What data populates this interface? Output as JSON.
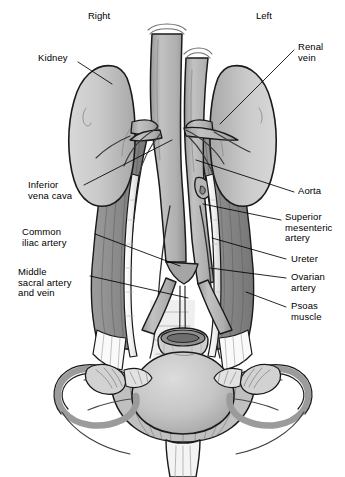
{
  "figure": {
    "kind": "anatomical-illustration",
    "background_color": "#ffffff",
    "line_color": "#1a1a1a",
    "label_color": "#000000"
  },
  "orientation": {
    "right": "Right",
    "left": "Left"
  },
  "labels": [
    {
      "id": "kidney",
      "text": "Kidney",
      "side": "left",
      "x": 38,
      "y": 55,
      "align": "left",
      "leader": [
        [
          78,
          62
        ],
        [
          112,
          84
        ]
      ]
    },
    {
      "id": "inferior-vena-cava",
      "text": "Inferior\nvena cava",
      "side": "left",
      "x": 28,
      "y": 181,
      "align": "left",
      "leader": [
        [
          82,
          186
        ],
        [
          170,
          140
        ]
      ]
    },
    {
      "id": "common-iliac-artery",
      "text": "Common\niliac artery",
      "side": "left",
      "x": 22,
      "y": 228,
      "align": "left",
      "leader": [
        [
          92,
          234
        ],
        [
          178,
          264
        ]
      ]
    },
    {
      "id": "middle-sacral",
      "text": "Middle\nsacral artery\nand vein",
      "side": "left",
      "x": 18,
      "y": 268,
      "align": "left",
      "leader": [
        [
          88,
          274
        ],
        [
          185,
          296
        ]
      ]
    },
    {
      "id": "renal-vein",
      "text": "Renal\nvein",
      "side": "right",
      "x": 297,
      "y": 44,
      "align": "left",
      "leader": [
        [
          295,
          50
        ],
        [
          222,
          122
        ]
      ]
    },
    {
      "id": "aorta",
      "text": "Aorta",
      "side": "right",
      "x": 297,
      "y": 188,
      "align": "left",
      "leader": [
        [
          295,
          193
        ],
        [
          196,
          160
        ]
      ]
    },
    {
      "id": "superior-mesenteric-artery",
      "text": "Superior\nmesenteric\nartery",
      "side": "right",
      "x": 284,
      "y": 214,
      "align": "left",
      "leader": [
        [
          281,
          220
        ],
        [
          205,
          205
        ]
      ]
    },
    {
      "id": "ureter",
      "text": "Ureter",
      "side": "right",
      "x": 290,
      "y": 256,
      "align": "left",
      "leader": [
        [
          287,
          260
        ],
        [
          214,
          238
        ]
      ]
    },
    {
      "id": "ovarian-artery",
      "text": "Ovarian\nartery",
      "side": "right",
      "x": 290,
      "y": 274,
      "align": "left",
      "leader": [
        [
          287,
          279
        ],
        [
          212,
          268
        ]
      ]
    },
    {
      "id": "psoas-muscle",
      "text": "Psoas\nmuscle",
      "side": "right",
      "x": 290,
      "y": 303,
      "align": "left",
      "leader": [
        [
          287,
          308
        ],
        [
          246,
          292
        ]
      ]
    }
  ],
  "structures": [
    {
      "id": "right-kidney",
      "name": "Right kidney",
      "tone": "#c9c9c9"
    },
    {
      "id": "left-kidney",
      "name": "Left kidney",
      "tone": "#c9c9c9"
    },
    {
      "id": "inferior-vena-cava",
      "name": "Inferior vena cava",
      "tone": "#b4b4b4"
    },
    {
      "id": "abdominal-aorta",
      "name": "Abdominal aorta",
      "tone": "#b0b0b0"
    },
    {
      "id": "right-psoas-muscle",
      "name": "Right psoas muscle",
      "tone": "#8e8e8e"
    },
    {
      "id": "left-psoas-muscle",
      "name": "Left psoas muscle",
      "tone": "#8e8e8e"
    },
    {
      "id": "right-ureter",
      "name": "Right ureter",
      "tone": "#f2f2f2"
    },
    {
      "id": "left-ureter",
      "name": "Left ureter",
      "tone": "#f2f2f2"
    },
    {
      "id": "uterus",
      "name": "Uterus",
      "tone": "#c5c5c5"
    },
    {
      "id": "broad-ligament",
      "name": "Broad ligament",
      "tone": "#bdbdbd"
    },
    {
      "id": "right-fallopian-tube",
      "name": "Right fallopian tube",
      "tone": "#9e9e9e"
    },
    {
      "id": "left-fallopian-tube",
      "name": "Left fallopian tube",
      "tone": "#9e9e9e"
    },
    {
      "id": "right-ovary",
      "name": "Right ovary",
      "tone": "#d5d5d5"
    },
    {
      "id": "left-ovary",
      "name": "Left ovary",
      "tone": "#d5d5d5"
    },
    {
      "id": "vagina",
      "name": "Vagina",
      "tone": "#ededed"
    },
    {
      "id": "sacral-promontory",
      "name": "Sacral promontory",
      "tone": "#8a8a8a"
    }
  ]
}
